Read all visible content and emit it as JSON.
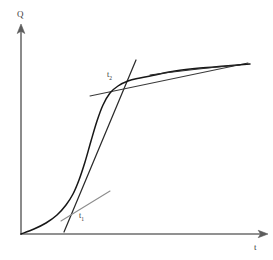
{
  "figure": {
    "background_color": "#ffffff",
    "width": 273,
    "height": 260
  },
  "axes": {
    "y_axis": {
      "label": "Q",
      "name": "quantity-axis",
      "arrow": "up",
      "color": "#6e6e6e",
      "origin_px": [
        21,
        234
      ],
      "tip_px": [
        21,
        27
      ]
    },
    "x_axis": {
      "label": "t",
      "name": "time-axis",
      "arrow": "right",
      "color": "#6e6e6e",
      "origin_px": [
        21,
        234
      ],
      "tip_px": [
        266,
        234
      ]
    }
  },
  "annotations": {
    "t1": {
      "label_main": "t",
      "label_sub": "1",
      "meaning": "inflection-start-tangent-point"
    },
    "t2": {
      "label_main": "t",
      "label_sub": "2",
      "meaning": "inflection-end-tangent-point"
    }
  },
  "colors": {
    "axis": "#6e6e6e",
    "curve": "#171717",
    "tangent_light": "#8d8d8d",
    "tangent_dark": "#2b2b2b",
    "asymptote": "#3a3a3a",
    "text": "#2e2e2e"
  },
  "chart_data": {
    "type": "line",
    "title": "",
    "xlabel": "t",
    "ylabel": "Q",
    "grid": false,
    "legend": null,
    "xlim": [
      0,
      1
    ],
    "ylim": [
      0,
      1
    ],
    "series": [
      {
        "name": "sigmoid-growth-curve",
        "kind": "curve",
        "color": "#171717",
        "points_px": [
          [
            21,
            234
          ],
          [
            34,
            229
          ],
          [
            46,
            223
          ],
          [
            57,
            215
          ],
          [
            66,
            205
          ],
          [
            73,
            194
          ],
          [
            79,
            180
          ],
          [
            85,
            162
          ],
          [
            91,
            141
          ],
          [
            97,
            121
          ],
          [
            103,
            105
          ],
          [
            110,
            93
          ],
          [
            118,
            86
          ],
          [
            128,
            81
          ],
          [
            140,
            78
          ],
          [
            155,
            75
          ],
          [
            175,
            71
          ],
          [
            200,
            68
          ],
          [
            225,
            66
          ],
          [
            250,
            64
          ]
        ]
      },
      {
        "name": "tangent-at-t1",
        "kind": "tangent",
        "at": "t1",
        "color": "#8d8d8d",
        "endpoints_px": [
          [
            61,
            221
          ],
          [
            110,
            191
          ]
        ]
      },
      {
        "name": "tangent-steep-through-inflection",
        "kind": "tangent",
        "at": "inflection",
        "color": "#2b2b2b",
        "endpoints_px": [
          [
            64,
            232
          ],
          [
            136,
            60
          ]
        ]
      },
      {
        "name": "tangent-at-t2-plateau",
        "kind": "tangent",
        "at": "t2",
        "color": "#3a3a3a",
        "endpoints_px": [
          [
            90,
            96
          ],
          [
            248,
            63
          ]
        ]
      }
    ]
  }
}
